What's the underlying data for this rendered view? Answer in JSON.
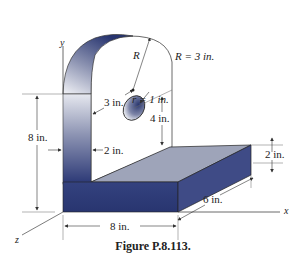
{
  "figure": {
    "caption": "Figure P.8.113.",
    "axes": {
      "x": "x",
      "y": "y",
      "z": "z"
    },
    "dimensions": {
      "outer_radius_symbol": "R",
      "outer_radius": "R = 3 in.",
      "hole_radius": "r = 1 in.",
      "arm_thickness_top": "3 in.",
      "hole_height": "4 in.",
      "total_height": "8 in.",
      "arm_thickness": "2 in.",
      "base_height": "2 in.",
      "base_depth": "6 in.",
      "base_length": "8 in."
    },
    "colors": {
      "dark_face": "#2b3a78",
      "top_face": "#9da3b8",
      "side_face": "#3d4a85",
      "line": "#555555"
    }
  }
}
